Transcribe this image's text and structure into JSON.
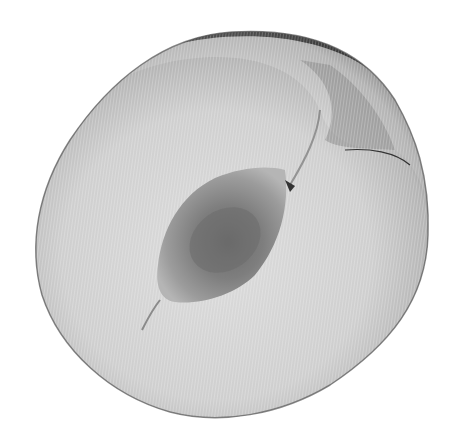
{
  "image": {
    "subject": "halved stone fruit, cut face with pit cavity",
    "style": "grayscale photograph with fine vertical line screen texture",
    "colors": {
      "background": "#ffffff",
      "flesh_light": "#d8d8d8",
      "flesh_mid": "#bdbdbd",
      "flesh_edge": "#8f8f8f",
      "skin_dark": "#2e2e2e",
      "pit_outer": "#9a9a9a",
      "pit_inner": "#6e6e6e"
    }
  }
}
